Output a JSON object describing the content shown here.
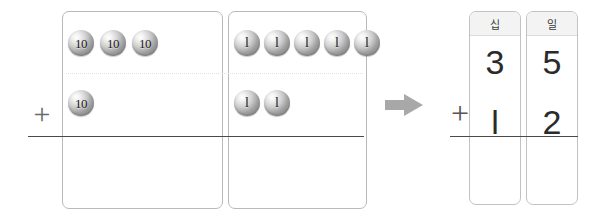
{
  "worksheet": {
    "title": "Place-value addition with base-ten discs",
    "operator_symbol": "+",
    "arrow_symbol": "arrow-right"
  },
  "manipulatives": {
    "tens_box": {
      "label": "tens-place-box",
      "rows": [
        {
          "name": "addend-1-tens",
          "token_label": "10",
          "count": 3
        },
        {
          "name": "addend-2-tens",
          "token_label": "10",
          "count": 1
        }
      ]
    },
    "ones_box": {
      "label": "ones-place-box",
      "rows": [
        {
          "name": "addend-1-ones",
          "token_label": "l",
          "count": 5
        },
        {
          "name": "addend-2-ones",
          "token_label": "l",
          "count": 2
        }
      ]
    }
  },
  "numeric": {
    "columns": [
      {
        "key": "tens",
        "header": "십",
        "top_digit": "3",
        "bottom_digit": "l"
      },
      {
        "key": "ones",
        "header": "일",
        "top_digit": "5",
        "bottom_digit": "2"
      }
    ],
    "operator": "+"
  },
  "colors": {
    "box_border": "#b9b9b9",
    "column_border": "#c2c2c2",
    "header_fill": "#f3f3f3",
    "rule_line": "#4a4a4a",
    "dotted_sep": "#e8dede",
    "arrow": "#a8a8a8",
    "digit_text": "#2b2b2b",
    "token_text": "#1a1a1a"
  }
}
